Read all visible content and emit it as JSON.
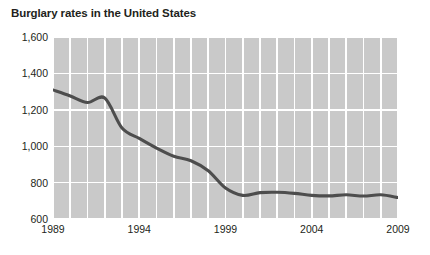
{
  "chart_data": {
    "type": "line",
    "title": "Burglary rates in the United States",
    "xlabel": "",
    "ylabel": "",
    "x": [
      1989,
      1990,
      1991,
      1992,
      1993,
      1994,
      1995,
      1996,
      1997,
      1998,
      1999,
      2000,
      2001,
      2002,
      2003,
      2004,
      2005,
      2006,
      2007,
      2008,
      2009
    ],
    "values": [
      1309,
      1276,
      1240,
      1265,
      1100,
      1043,
      990,
      945,
      920,
      865,
      770,
      730,
      745,
      747,
      741,
      730,
      727,
      733,
      726,
      733,
      718
    ],
    "categories": [
      "1989",
      "1990",
      "1991",
      "1992",
      "1993",
      "1994",
      "1995",
      "1996",
      "1997",
      "1998",
      "1999",
      "2000",
      "2001",
      "2002",
      "2003",
      "2004",
      "2005",
      "2006",
      "2007",
      "2008",
      "2009"
    ],
    "series": [
      {
        "name": "Burglary rate",
        "values": [
          1309,
          1276,
          1240,
          1265,
          1100,
          1043,
          990,
          945,
          920,
          865,
          770,
          730,
          745,
          747,
          741,
          730,
          727,
          733,
          726,
          733,
          718
        ],
        "color": "#4d4d4d"
      }
    ],
    "ylim": [
      600,
      1600
    ],
    "xlim": [
      1989,
      2009
    ],
    "yticks": [
      600,
      800,
      1000,
      1200,
      1400,
      1600
    ],
    "ytick_labels": [
      "600",
      "800",
      "1,000",
      "1,200",
      "1,400",
      "1,600"
    ],
    "xticks": [
      1989,
      1994,
      1999,
      2004,
      2009
    ],
    "xtick_labels": [
      "1989",
      "1994",
      "1999",
      "2004",
      "2009"
    ],
    "grid": true,
    "grid_color": "#ffffff",
    "legend": "none",
    "plot_background": "#c9c9c9",
    "figure_background": "#ffffff",
    "line_color": "#4d4d4d"
  }
}
